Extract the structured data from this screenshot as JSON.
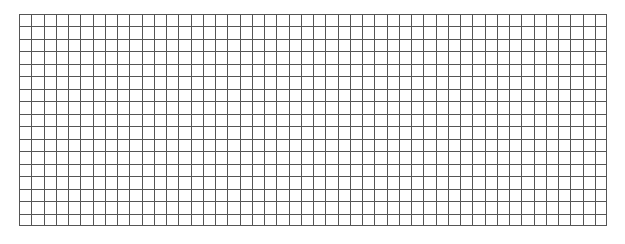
{
  "grid": {
    "columns": 48,
    "rows": 17,
    "line_color": "#555555",
    "background": "#ffffff"
  }
}
